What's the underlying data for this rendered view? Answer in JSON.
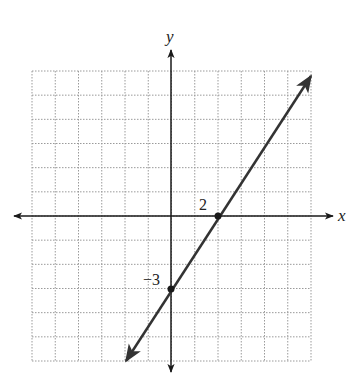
{
  "figure": {
    "type": "coordinate-plane-line-graph",
    "axis_labels": {
      "x": "x",
      "y": "y"
    },
    "grid": {
      "x_min": -6,
      "x_max": 6,
      "y_min": -6,
      "y_max": 6,
      "step": 1,
      "style": "dotted"
    },
    "point_labels": {
      "x_intercept": "2",
      "y_intercept": "−3"
    },
    "points": [
      {
        "name": "x-intercept",
        "x": 2,
        "y": 0
      },
      {
        "name": "y-intercept",
        "x": 0,
        "y": -3
      }
    ],
    "line": {
      "slope": 1.5,
      "intercept": -3,
      "equation": "y = (3/2)x - 3",
      "arrows": "both"
    },
    "colors": {
      "grid": "#9a9a9a",
      "axis": "#1a1a1a",
      "line": "#333333",
      "point": "#1a1a1a"
    }
  }
}
